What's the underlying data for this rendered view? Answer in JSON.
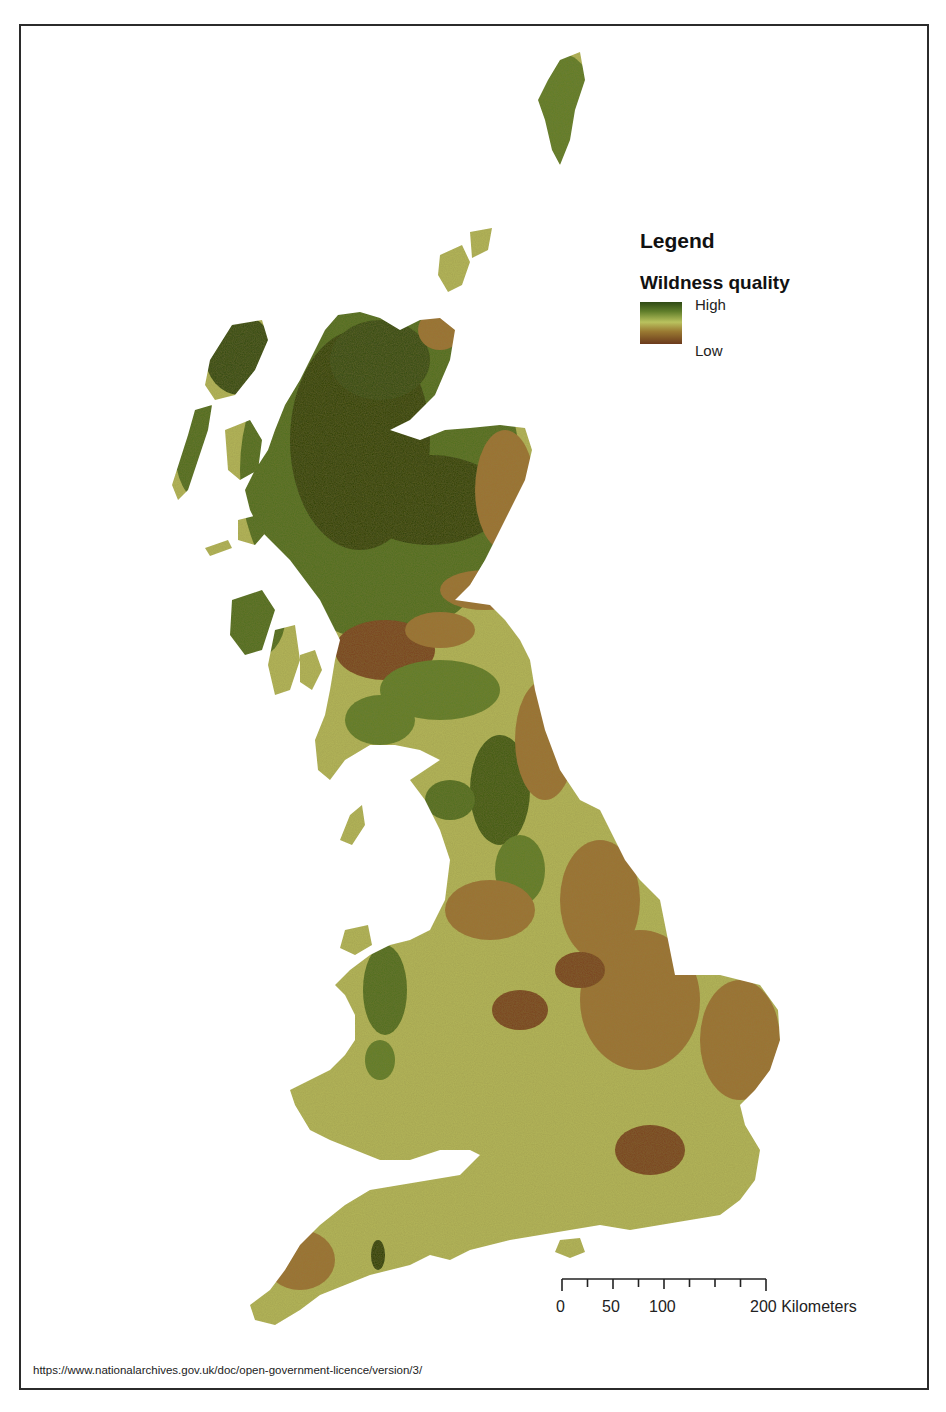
{
  "legend": {
    "title": "Legend",
    "subtitle": "Wildness quality",
    "high_label": "High",
    "low_label": "Low",
    "gradient_colors": [
      "#2f4a14",
      "#5f7d2a",
      "#b9c25e",
      "#9a7a32",
      "#6b3a1c"
    ]
  },
  "scalebar": {
    "labels": [
      "0",
      "50",
      "100",
      "200 Kilometers"
    ],
    "max_km": 200,
    "units": "Kilometers"
  },
  "footer": {
    "license_url_text": "https://www.nationalarchives.gov.uk/doc/open-government-licence/version/3/"
  },
  "map": {
    "subject": "Great Britain",
    "theme": "Wildness quality",
    "colors": {
      "very_high": "#2a4010",
      "high": "#4f6e22",
      "medium": "#b3b55a",
      "low": "#9c7236",
      "very_low": "#7a4320",
      "background": "#ffffff",
      "frame": "#2b2b2b"
    }
  }
}
